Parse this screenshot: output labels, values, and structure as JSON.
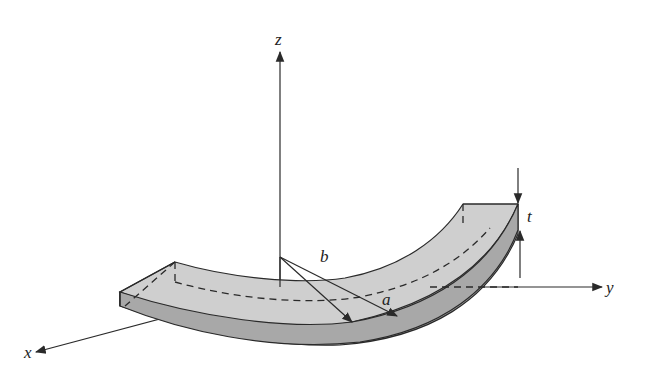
{
  "figure": {
    "axes": {
      "x_label": "x",
      "y_label": "y",
      "z_label": "z"
    },
    "dimensions": {
      "inner_radius_label": "a",
      "outer_radius_label": "b",
      "thickness_label": "t"
    },
    "colors": {
      "top_face": "#cfcfcf",
      "side_face": "#a8a8a8",
      "lines": "#2a2a2a",
      "background": "#ffffff"
    }
  }
}
